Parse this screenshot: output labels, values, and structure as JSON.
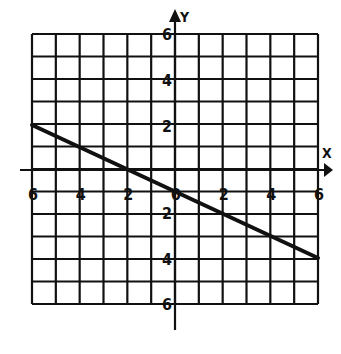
{
  "chart_data": {
    "type": "line",
    "title": "",
    "xlabel": "X",
    "ylabel": "Y",
    "xlim": [
      -6,
      6
    ],
    "ylim": [
      -6,
      6
    ],
    "grid": true,
    "x_ticks": [
      "-6",
      "-4",
      "-2",
      "0",
      "2",
      "4",
      "6"
    ],
    "y_ticks": [
      "6",
      "4",
      "2",
      "2",
      "4",
      "6"
    ],
    "series": [
      {
        "name": "line",
        "x": [
          -6,
          6
        ],
        "y": [
          2,
          -4
        ]
      }
    ]
  },
  "colors": {
    "ink": "#111111",
    "background": "#ffffff"
  }
}
